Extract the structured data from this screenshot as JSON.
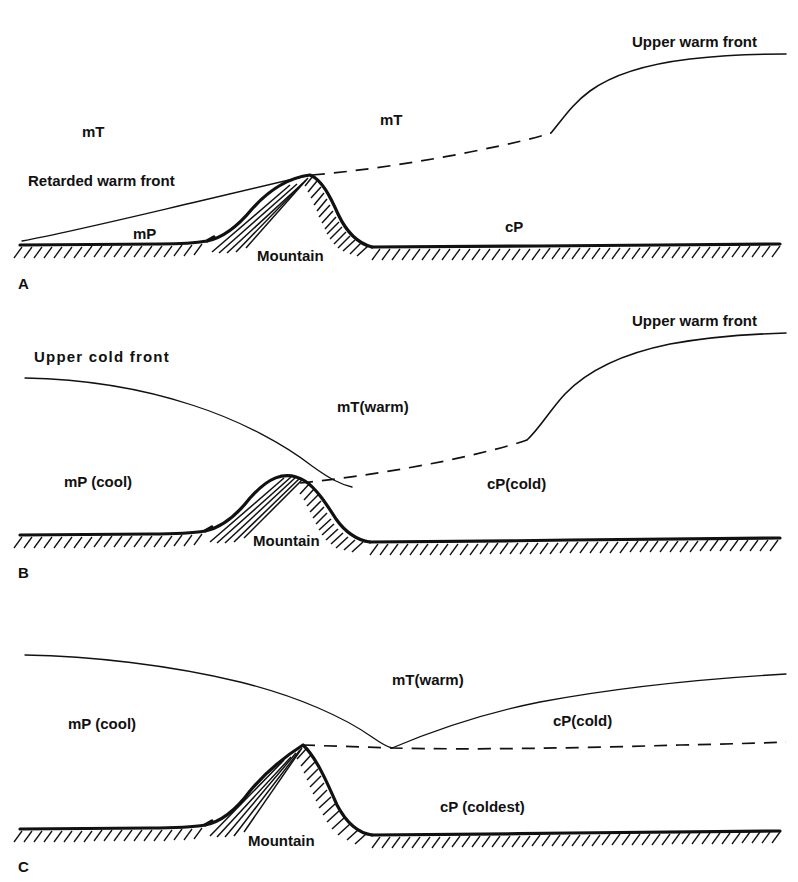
{
  "figure": {
    "title_present": false,
    "panels": [
      {
        "id": "A",
        "letter": "A",
        "labels": {
          "upper_warm_front": "Upper warm front",
          "air_mass_upper_left": "mT",
          "air_mass_upper_mid": "mT",
          "retarded_warm_front": "Retarded warm front",
          "air_mass_left_low": "mP",
          "mountain": "Mountain",
          "air_mass_right_low": "cP"
        }
      },
      {
        "id": "B",
        "letter": "B",
        "labels": {
          "upper_warm_front": "Upper warm front",
          "upper_cold_front": "Upper cold front",
          "air_mass_warm": "mT(warm)",
          "air_mass_cool": "mP (cool)",
          "air_mass_cold": "cP(cold)",
          "mountain": "Mountain"
        }
      },
      {
        "id": "C",
        "letter": "C",
        "labels": {
          "air_mass_warm": "mT(warm)",
          "air_mass_cool": "mP (cool)",
          "air_mass_cold": "cP(cold)",
          "air_mass_coldest": "cP (coldest)",
          "mountain": "Mountain"
        }
      }
    ]
  },
  "style": {
    "ink": "#111111",
    "paper": "#ffffff"
  }
}
